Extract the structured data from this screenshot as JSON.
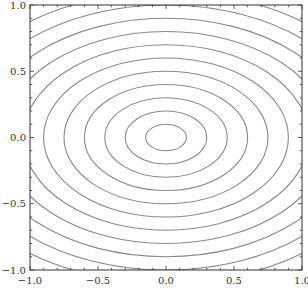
{
  "chart_data": {
    "type": "contour",
    "title": "",
    "xlabel": "",
    "ylabel": "",
    "xlim": [
      -1.0,
      1.0
    ],
    "ylim": [
      -1.0,
      1.0
    ],
    "grid": false,
    "legend": null,
    "x_ticks": [
      -1.0,
      -0.5,
      0.0,
      0.5,
      1.0
    ],
    "x_tick_labels": [
      "−1.0",
      "−0.5",
      "0.0",
      "0.5",
      "1.0"
    ],
    "y_ticks": [
      -1.0,
      -0.5,
      0.0,
      0.5,
      1.0
    ],
    "y_tick_labels": [
      "−1.0",
      "−0.5",
      "0.0",
      "0.5",
      "1.0"
    ],
    "minor_tick_step": 0.1,
    "function_description": "concentric ellipses centered at (0,0): sqrt((x/1.5)^2 + y^2) = level",
    "center": [
      0.0,
      0.0
    ],
    "x_to_y_semi_axis_ratio": 1.5,
    "levels": [
      0.1,
      0.2,
      0.3,
      0.4,
      0.5,
      0.6,
      0.7,
      0.8,
      0.9,
      1.0,
      1.1
    ],
    "line_color": "#8a8a8a",
    "frame_color": "#333333"
  }
}
